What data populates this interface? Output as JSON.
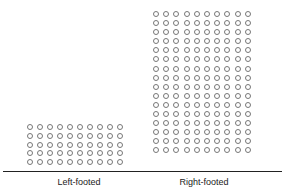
{
  "chart_data": {
    "type": "table",
    "subtype": "pictogram",
    "title": "",
    "categories": [
      "Left-footed",
      "Right-footed"
    ],
    "values": [
      50,
      160
    ],
    "grid": {
      "Left-footed": {
        "columns": 10,
        "rows": 5
      },
      "Right-footed": {
        "columns": 10,
        "rows": 16
      }
    },
    "symbol": "circle",
    "xlabel": "",
    "ylabel": "",
    "legend": "none"
  },
  "labels": {
    "left": "Left-footed",
    "right": "Right-footed"
  }
}
